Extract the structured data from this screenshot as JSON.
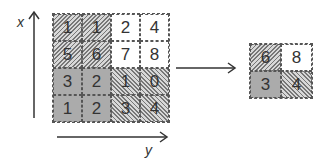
{
  "axes": {
    "x_label": "x",
    "y_label": "y"
  },
  "input_grid": {
    "rows": [
      [
        {
          "v": "1",
          "fill": "hatch-a"
        },
        {
          "v": "1",
          "fill": "hatch-a"
        },
        {
          "v": "2",
          "fill": "blank"
        },
        {
          "v": "4",
          "fill": "blank"
        }
      ],
      [
        {
          "v": "5",
          "fill": "hatch-a"
        },
        {
          "v": "6",
          "fill": "hatch-a"
        },
        {
          "v": "7",
          "fill": "blank"
        },
        {
          "v": "8",
          "fill": "blank"
        }
      ],
      [
        {
          "v": "3",
          "fill": "solid"
        },
        {
          "v": "2",
          "fill": "solid"
        },
        {
          "v": "1",
          "fill": "hatch-b"
        },
        {
          "v": "0",
          "fill": "hatch-b"
        }
      ],
      [
        {
          "v": "1",
          "fill": "solid"
        },
        {
          "v": "2",
          "fill": "solid"
        },
        {
          "v": "3",
          "fill": "hatch-b"
        },
        {
          "v": "4",
          "fill": "hatch-b"
        }
      ]
    ]
  },
  "output_grid": {
    "rows": [
      [
        {
          "v": "6",
          "fill": "hatch-a"
        },
        {
          "v": "8",
          "fill": "blank"
        }
      ],
      [
        {
          "v": "3",
          "fill": "solid"
        },
        {
          "v": "4",
          "fill": "hatch-b"
        }
      ]
    ]
  },
  "colors": {
    "arrow": "#333333",
    "solid": "#ababab",
    "hatch": "#777777"
  }
}
